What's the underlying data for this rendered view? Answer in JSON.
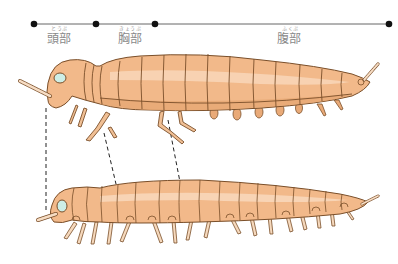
{
  "diagram": {
    "title": "",
    "segments": [
      {
        "id": "head",
        "label": "頭部",
        "reading": "とうぶ",
        "start_x": 34,
        "end_x": 96
      },
      {
        "id": "thorax",
        "label": "胸部",
        "reading": "きょうぶ",
        "start_x": 96,
        "end_x": 155
      },
      {
        "id": "abdomen",
        "label": "腹部",
        "reading": "ふくぶ",
        "start_x": 155,
        "end_x": 389
      }
    ],
    "figures": [
      {
        "id": "upper",
        "description": "adult insect-like arthropod with 3 pairs of thoracic legs and abdominal stubs"
      },
      {
        "id": "lower",
        "description": "centipede-like arthropod with many leg pairs"
      }
    ],
    "colors": {
      "body": "#f2b98a",
      "body_light": "#f8d6b8",
      "outline": "#7a4f2a",
      "leg": "#f4d3b0",
      "eye": "#cdeee6",
      "line": "#555555",
      "dot": "#111111",
      "label": "#8a8a8a"
    }
  }
}
